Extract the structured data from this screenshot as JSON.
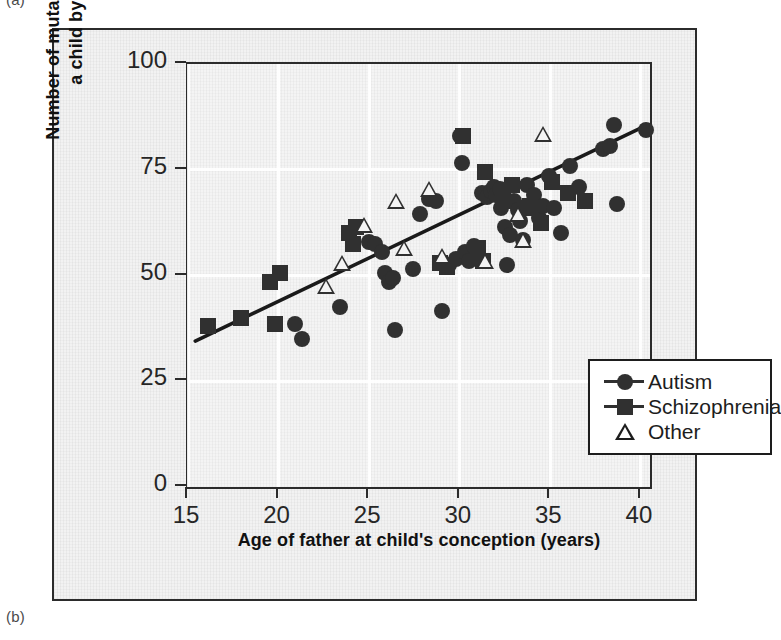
{
  "panels": {
    "label_a": "(a)",
    "label_b": "(b)"
  },
  "chart_data": {
    "type": "scatter",
    "title": "",
    "xlabel": "Age of father at child's conception (years)",
    "ylabel": "Number of mutations transmitted to\na child by either parent",
    "xlim": [
      15,
      40.5
    ],
    "ylim": [
      0,
      100
    ],
    "xticks": [
      15,
      20,
      25,
      30,
      35,
      40
    ],
    "yticks": [
      0,
      25,
      50,
      75,
      100
    ],
    "xtick_labels": [
      "15",
      "20",
      "25",
      "30",
      "35",
      "40"
    ],
    "ytick_labels": [
      "0",
      "25",
      "50",
      "75",
      "100"
    ],
    "grid": true,
    "grid_color": "#ffffff",
    "legend_position": "inside-lower-right",
    "marker_color": "#303030",
    "trendline": {
      "type": "linear",
      "x_start": 15.4,
      "y_start": 34.5,
      "x_end": 40.3,
      "y_end": 85.5,
      "color": "#1a1a1a",
      "width": 3.5
    },
    "series": [
      {
        "name": "Autism",
        "marker": "circle",
        "points": [
          [
            20.9,
            38.5
          ],
          [
            21.3,
            35.0
          ],
          [
            23.4,
            42.5
          ],
          [
            25.0,
            58.0
          ],
          [
            25.3,
            57.5
          ],
          [
            25.7,
            55.5
          ],
          [
            25.9,
            50.5
          ],
          [
            26.1,
            48.5
          ],
          [
            26.3,
            49.5
          ],
          [
            26.4,
            37.0
          ],
          [
            27.4,
            51.5
          ],
          [
            27.8,
            64.5
          ],
          [
            28.3,
            68.0
          ],
          [
            28.7,
            67.5
          ],
          [
            29.0,
            41.5
          ],
          [
            29.4,
            52.5
          ],
          [
            29.8,
            54.0
          ],
          [
            30.0,
            83.0
          ],
          [
            30.1,
            76.5
          ],
          [
            30.3,
            55.5
          ],
          [
            30.5,
            53.5
          ],
          [
            30.8,
            57.0
          ],
          [
            31.2,
            69.5
          ],
          [
            31.5,
            68.5
          ],
          [
            31.7,
            70.0
          ],
          [
            31.9,
            71.0
          ],
          [
            32.0,
            69.0
          ],
          [
            32.2,
            70.5
          ],
          [
            32.3,
            66.0
          ],
          [
            32.5,
            61.5
          ],
          [
            32.6,
            52.5
          ],
          [
            32.8,
            59.5
          ],
          [
            33.0,
            67.5
          ],
          [
            33.2,
            65.5
          ],
          [
            33.3,
            63.0
          ],
          [
            33.5,
            58.5
          ],
          [
            33.7,
            71.5
          ],
          [
            34.1,
            69.0
          ],
          [
            34.4,
            63.5
          ],
          [
            34.6,
            66.5
          ],
          [
            34.9,
            73.5
          ],
          [
            35.2,
            66.0
          ],
          [
            35.6,
            60.0
          ],
          [
            36.1,
            76.0
          ],
          [
            36.6,
            71.0
          ],
          [
            37.9,
            80.0
          ],
          [
            38.3,
            80.5
          ],
          [
            38.5,
            85.5
          ],
          [
            38.7,
            67.0
          ],
          [
            40.3,
            84.5
          ]
        ]
      },
      {
        "name": "Schizophrenia",
        "marker": "square",
        "points": [
          [
            16.1,
            38.0
          ],
          [
            17.9,
            40.0
          ],
          [
            19.5,
            48.5
          ],
          [
            20.1,
            50.5
          ],
          [
            19.8,
            38.5
          ],
          [
            23.9,
            60.0
          ],
          [
            24.3,
            61.5
          ],
          [
            24.1,
            57.5
          ],
          [
            28.9,
            53.0
          ],
          [
            29.3,
            52.0
          ],
          [
            30.2,
            83.0
          ],
          [
            31.4,
            74.5
          ],
          [
            32.4,
            67.5
          ],
          [
            32.9,
            71.5
          ],
          [
            33.6,
            66.0
          ],
          [
            33.9,
            66.5
          ],
          [
            34.5,
            62.5
          ],
          [
            35.1,
            72.0
          ],
          [
            36.0,
            69.5
          ],
          [
            36.9,
            67.5
          ],
          [
            31.0,
            56.5
          ],
          [
            31.3,
            53.5
          ]
        ]
      },
      {
        "name": "Other",
        "marker": "triangle",
        "points": [
          [
            22.6,
            47.5
          ],
          [
            23.5,
            53.0
          ],
          [
            24.7,
            62.0
          ],
          [
            26.5,
            67.5
          ],
          [
            28.3,
            70.5
          ],
          [
            29.0,
            54.5
          ],
          [
            31.4,
            53.5
          ],
          [
            33.2,
            64.5
          ],
          [
            33.5,
            58.5
          ],
          [
            34.6,
            83.5
          ],
          [
            26.9,
            56.5
          ]
        ]
      }
    ]
  },
  "legend": {
    "items": [
      {
        "label": "Autism",
        "marker": "circle"
      },
      {
        "label": "Schizophrenia",
        "marker": "square"
      },
      {
        "label": "Other",
        "marker": "triangle"
      }
    ]
  }
}
